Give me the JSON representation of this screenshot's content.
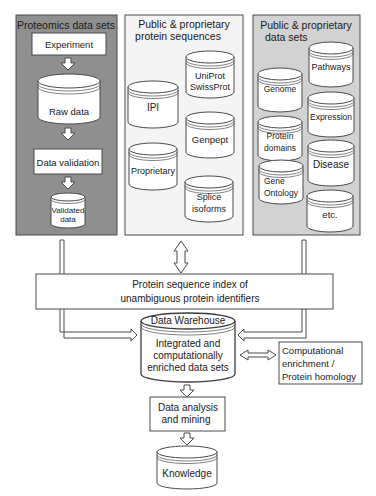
{
  "colors": {
    "panel_proteomics": "#8f8f8f",
    "panel_sequences": "#f4f4f4",
    "panel_datasets": "#d2d2d2",
    "stroke": "#4a4a4a",
    "box_fill": "#ffffff"
  },
  "panels": {
    "proteomics": {
      "title": "Proteomics data sets",
      "steps": {
        "experiment": "Experiment",
        "raw_data": "Raw data",
        "data_validation": "Data validation",
        "validated_data_line1": "Validated",
        "validated_data_line2": "data"
      }
    },
    "sequences": {
      "title_line1": "Public & proprietary",
      "title_line2": "protein sequences",
      "databases": {
        "uniprot_line1": "UniProt",
        "uniprot_line2": "SwissProt",
        "ipi": "IPI",
        "genpept": "Genpept",
        "proprietary": "Proprietary",
        "splice_line1": "Splice",
        "splice_line2": "isoforms"
      }
    },
    "datasets": {
      "title_line1": "Public & proprietary",
      "title_line2": "data sets",
      "databases": {
        "pathways": "Pathways",
        "genome": "Genome",
        "expression": "Expression",
        "protein_domains_line1": "Protein",
        "protein_domains_line2": "domains",
        "disease": "Disease",
        "gene_ontology_line1": "Gene",
        "gene_ontology_line2": "Ontology",
        "etc": "etc."
      }
    }
  },
  "index": {
    "line1": "Protein sequence index of",
    "line2": "unambiguous protein identifiers"
  },
  "warehouse": {
    "title": "Data Warehouse",
    "line1": "Integrated and",
    "line2": "computationally",
    "line3": "enriched data sets"
  },
  "enrichment": {
    "line1": "Computational",
    "line2": "enrichment /",
    "line3": "Protein homology"
  },
  "analysis": {
    "line1": "Data analysis",
    "line2": "and mining"
  },
  "knowledge": {
    "label": "Knowledge"
  }
}
